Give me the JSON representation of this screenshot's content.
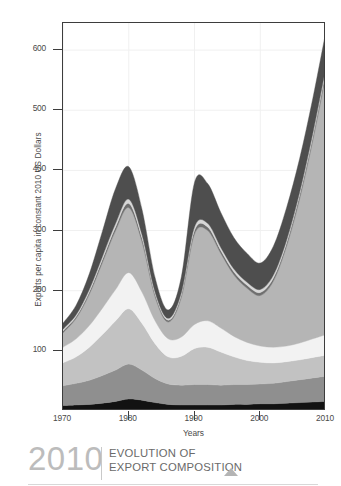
{
  "chart_data": {
    "type": "area",
    "stacked": true,
    "title": "",
    "xlabel": "Years",
    "ylabel": "Exports per capita in constant 2010 US Dollars",
    "xlim": [
      1970,
      2010
    ],
    "ylim": [
      0,
      645
    ],
    "grid": true,
    "legend_position": "none",
    "x_ticks": [
      1970,
      1980,
      1990,
      2000,
      2010
    ],
    "x_tick_labels": [
      "1970",
      "1980",
      "1990",
      "2000",
      "2010"
    ],
    "y_ticks": [
      100,
      200,
      300,
      400,
      500,
      600
    ],
    "y_tick_labels": [
      "100",
      "200",
      "300",
      "400",
      "500",
      "600"
    ],
    "x": [
      1970,
      1972,
      1974,
      1976,
      1978,
      1980,
      1982,
      1984,
      1986,
      1988,
      1990,
      1992,
      1994,
      1996,
      1998,
      2000,
      2002,
      2004,
      2006,
      2008,
      2010
    ],
    "series": [
      {
        "name": "layer-1-base-black",
        "color": "#121212",
        "values": [
          9,
          10,
          11,
          13,
          16,
          20,
          18,
          14,
          11,
          10,
          10,
          10,
          10,
          11,
          11,
          12,
          12,
          13,
          14,
          15,
          16
        ]
      },
      {
        "name": "layer-2-medium-gray",
        "color": "#8f8f8f",
        "values": [
          33,
          36,
          40,
          46,
          52,
          58,
          50,
          40,
          34,
          33,
          34,
          34,
          33,
          33,
          33,
          33,
          34,
          36,
          38,
          40,
          42
        ]
      },
      {
        "name": "layer-3-light-gray",
        "color": "#c2c2c2",
        "values": [
          38,
          44,
          55,
          68,
          82,
          92,
          78,
          58,
          45,
          48,
          60,
          62,
          55,
          46,
          40,
          36,
          34,
          33,
          33,
          34,
          35
        ]
      },
      {
        "name": "layer-4-near-white",
        "color": "#f2f2f2",
        "values": [
          26,
          30,
          36,
          44,
          52,
          60,
          52,
          38,
          30,
          32,
          40,
          44,
          40,
          34,
          30,
          27,
          26,
          26,
          28,
          31,
          34
        ]
      },
      {
        "name": "layer-5-mid-light-gray",
        "color": "#b5b5b5",
        "values": [
          24,
          34,
          52,
          76,
          98,
          108,
          84,
          40,
          28,
          66,
          150,
          150,
          124,
          102,
          90,
          84,
          110,
          166,
          240,
          330,
          432
        ]
      },
      {
        "name": "layer-6-thin-dark",
        "color": "#6f6f6f",
        "values": [
          3,
          3,
          4,
          5,
          6,
          7,
          6,
          4,
          3,
          4,
          6,
          6,
          5,
          5,
          5,
          5,
          5,
          5,
          6,
          6,
          7
        ]
      },
      {
        "name": "layer-7-thin-pale",
        "color": "#d7d7d7",
        "values": [
          3,
          3,
          4,
          5,
          6,
          7,
          6,
          4,
          3,
          4,
          6,
          6,
          5,
          5,
          5,
          5,
          5,
          5,
          5,
          6,
          6
        ]
      },
      {
        "name": "layer-8-top-dark-gray",
        "color": "#4e4e4e",
        "values": [
          10,
          16,
          26,
          42,
          58,
          54,
          42,
          24,
          14,
          26,
          74,
          66,
          58,
          52,
          48,
          44,
          48,
          54,
          56,
          58,
          60
        ]
      }
    ]
  },
  "axes": {
    "y_title": "Exports per capita in constant 2010 US Dollars",
    "x_title": "Years"
  },
  "footer": {
    "year": "2010",
    "title_line_1": "EVOLUTION OF",
    "title_line_2": "EXPORT COMPOSITION",
    "triangle": "triangle-up-icon"
  },
  "colors": {
    "frame": "#3d3d3d",
    "grid": "#f0f0f0",
    "text": "#4a4a4a",
    "footer_year": "#bcbcbc",
    "footer_title": "#6a6a6a",
    "footer_triangle": "#b4b4b4",
    "background": "#ffffff"
  }
}
